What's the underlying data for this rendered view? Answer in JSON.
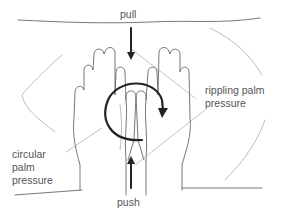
{
  "diagram": {
    "type": "illustration",
    "labels": {
      "pull": "pull",
      "push": "push",
      "rippling_line1": "rippling palm",
      "rippling_line2": "pressure",
      "circular_line1": "circular",
      "circular_line2": "palm",
      "circular_line3": "pressure"
    },
    "arrows": [
      {
        "name": "pull-arrow",
        "direction": "down"
      },
      {
        "name": "push-arrow",
        "direction": "up"
      },
      {
        "name": "circular-arrow",
        "direction": "clockwise"
      }
    ],
    "colors": {
      "line": "#444444",
      "arrow": "#222222",
      "text": "#555555",
      "background": "#ffffff"
    }
  }
}
